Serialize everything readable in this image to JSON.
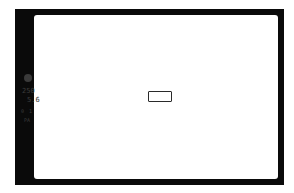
{
  "viewfinder": {
    "frame_color": "#0a0a0a",
    "view_area_color": "#ffffff",
    "indicator_color": "#3c3c3c",
    "side_panel": {
      "focus_indicator": "focus-confirm-dot",
      "shutter_speed": "250",
      "aperture": "5.6",
      "indicator_left": "0",
      "indicator_right": "1",
      "mode": "PA"
    },
    "af_point": {
      "shape": "rectangle",
      "position": "center"
    }
  }
}
